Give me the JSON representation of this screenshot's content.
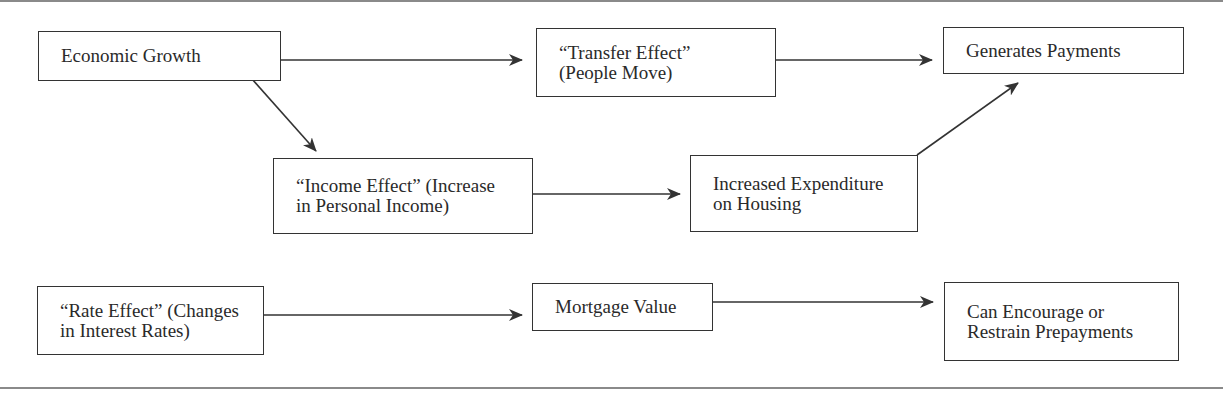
{
  "diagram": {
    "nodes": [
      {
        "id": "economic-growth",
        "label": "Economic Growth",
        "x": 38,
        "y": 31,
        "w": 243,
        "h": 50
      },
      {
        "id": "transfer-effect",
        "label": "“Transfer Effect”\n(People Move)",
        "x": 536,
        "y": 28,
        "w": 240,
        "h": 69
      },
      {
        "id": "generates-payments",
        "label": "Generates Payments",
        "x": 943,
        "y": 27,
        "w": 241,
        "h": 47
      },
      {
        "id": "income-effect",
        "label": "“Income Effect” (Increase\nin Personal Income)",
        "x": 273,
        "y": 158,
        "w": 260,
        "h": 76
      },
      {
        "id": "increased-expenditure",
        "label": "Increased Expenditure\non Housing",
        "x": 690,
        "y": 155,
        "w": 228,
        "h": 77
      },
      {
        "id": "rate-effect",
        "label": "“Rate Effect” (Changes\nin Interest Rates)",
        "x": 37,
        "y": 286,
        "w": 227,
        "h": 69
      },
      {
        "id": "mortgage-value",
        "label": "Mortgage Value",
        "x": 532,
        "y": 283,
        "w": 181,
        "h": 48
      },
      {
        "id": "can-encourage",
        "label": "Can Encourage or\nRestrain Prepayments",
        "x": 944,
        "y": 282,
        "w": 235,
        "h": 79
      }
    ],
    "edges": [
      {
        "from": "economic-growth",
        "to": "transfer-effect",
        "x1": 281,
        "y1": 60,
        "x2": 522,
        "y2": 60
      },
      {
        "from": "economic-growth",
        "to": "income-effect",
        "x1": 252,
        "y1": 79,
        "x2": 316,
        "y2": 151
      },
      {
        "from": "transfer-effect",
        "to": "generates-payments",
        "x1": 776,
        "y1": 60,
        "x2": 932,
        "y2": 60
      },
      {
        "from": "income-effect",
        "to": "increased-expenditure",
        "x1": 533,
        "y1": 194,
        "x2": 680,
        "y2": 194
      },
      {
        "from": "increased-expenditure",
        "to": "generates-payments",
        "x1": 917,
        "y1": 155,
        "x2": 1018,
        "y2": 83
      },
      {
        "from": "rate-effect",
        "to": "mortgage-value",
        "x1": 264,
        "y1": 315,
        "x2": 522,
        "y2": 315
      },
      {
        "from": "mortgage-value",
        "to": "can-encourage",
        "x1": 713,
        "y1": 302,
        "x2": 933,
        "y2": 302
      }
    ],
    "colors": {
      "line": "#333333",
      "rule": "#8a8a8a",
      "background": "#ffffff"
    }
  }
}
